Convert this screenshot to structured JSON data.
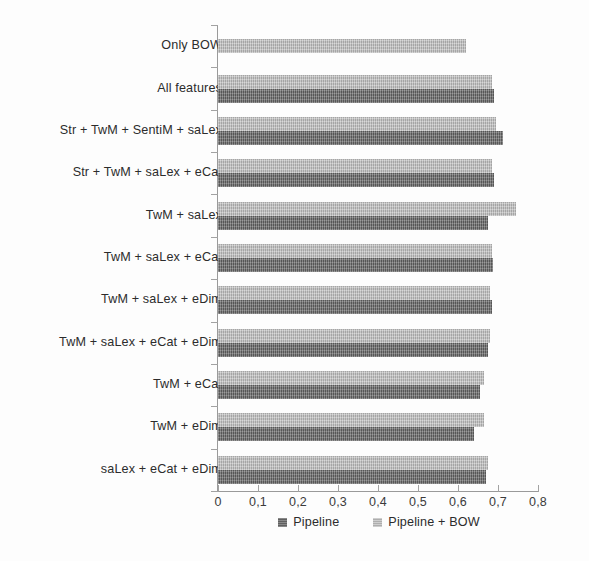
{
  "chart_data": {
    "type": "bar",
    "orientation": "horizontal",
    "title": "",
    "subtitle": "",
    "xlabel": "",
    "ylabel": "",
    "xlim": [
      0,
      0.8
    ],
    "grid": false,
    "legend_position": "bottom-center",
    "x_tick_labels": [
      "0",
      "0,1",
      "0,2",
      "0,3",
      "0,4",
      "0,5",
      "0,6",
      "0,7",
      "0,8"
    ],
    "x_tick_values": [
      0,
      0.1,
      0.2,
      0.3,
      0.4,
      0.5,
      0.6,
      0.7,
      0.8
    ],
    "categories": [
      "Only BOW",
      "All features",
      "Str + TwM + SentiM + saLex",
      "Str + TwM + saLex + eCat",
      "TwM + saLex",
      "TwM + saLex + eCat",
      "TwM + saLex + eDim",
      "TwM + saLex + eCat + eDim",
      "TwM + eCat",
      "TwM + eDim",
      "saLex +  eCat + eDim"
    ],
    "series": [
      {
        "name": "Pipeline",
        "color": "#6b6b6b",
        "values": [
          null,
          0.69,
          0.712,
          0.69,
          0.676,
          0.688,
          0.684,
          0.676,
          0.655,
          0.639,
          0.67
        ]
      },
      {
        "name": "Pipeline + BOW",
        "color": "#b9b9b9",
        "values": [
          0.62,
          0.684,
          0.696,
          0.684,
          0.744,
          0.684,
          0.68,
          0.68,
          0.666,
          0.664,
          0.674
        ]
      }
    ]
  },
  "legend": {
    "entries": [
      {
        "label": "Pipeline",
        "swatch": "dark"
      },
      {
        "label": "Pipeline + BOW",
        "swatch": "light"
      }
    ]
  }
}
